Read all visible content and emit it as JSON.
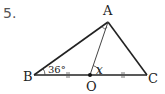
{
  "problem": {
    "number": "5."
  },
  "figure": {
    "vertices": {
      "A": {
        "label": "A",
        "x": 108,
        "y": 22
      },
      "B": {
        "label": "B",
        "x": 34,
        "y": 75
      },
      "C": {
        "label": "C",
        "x": 147,
        "y": 75
      },
      "O": {
        "label": "O",
        "x": 90,
        "y": 75
      }
    },
    "segments": [
      "AB",
      "AC",
      "BC",
      "AO"
    ],
    "angle_B_label": "36°",
    "angle_AOC_label": "x",
    "equal_marks": {
      "BO": "||",
      "OC": "||"
    },
    "right_angle_at": "A",
    "line_color": "#222222"
  }
}
